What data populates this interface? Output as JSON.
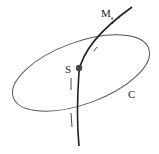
{
  "diagram": {
    "labels": {
      "manifold": "M",
      "manifold_sub": "s",
      "point": "S",
      "curve": "C"
    },
    "colors": {
      "stroke": "#222222",
      "ellipse": "#555555",
      "point": "#444444",
      "background": "#ffffff"
    }
  }
}
